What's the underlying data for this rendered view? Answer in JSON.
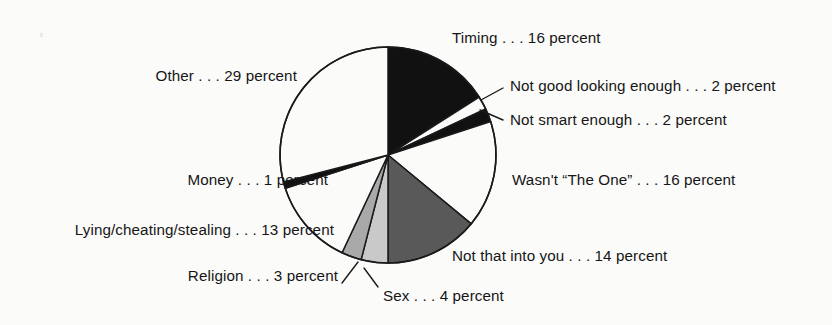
{
  "figure": {
    "background_color": "#fbfbfa",
    "text_color": "#161616",
    "outline_color": "#1a1a1a"
  },
  "chart_data": {
    "type": "pie",
    "title": "",
    "xlabel": "",
    "ylabel": "",
    "units": "percent",
    "start_angle_deg": 0,
    "direction": "clockwise",
    "center": {
      "x": 388,
      "y": 155
    },
    "radius": 108,
    "legend": "none",
    "grid": false,
    "categories": [
      "Timing",
      "Not good looking enough",
      "Not smart enough",
      "Wasn't “The One”",
      "Not that into you",
      "Sex",
      "Religion",
      "Lying/cheating/stealing",
      "Money",
      "Other"
    ],
    "values": [
      16,
      2,
      2,
      16,
      14,
      4,
      3,
      13,
      1,
      29
    ],
    "colors": [
      "#111111",
      "#fbfbfa",
      "#111111",
      "#fbfbfa",
      "#595959",
      "#c9c9c9",
      "#a9a9a9",
      "#fbfbfa",
      "#111111",
      "#fbfbfa"
    ],
    "slices": [
      {
        "label": "Timing",
        "value": 16,
        "color": "#111111"
      },
      {
        "label": "Not good looking enough",
        "value": 2,
        "color": "#fbfbfa"
      },
      {
        "label": "Not smart enough",
        "value": 2,
        "color": "#111111"
      },
      {
        "label": "Wasn't “The One”",
        "value": 16,
        "color": "#fbfbfa"
      },
      {
        "label": "Not that into you",
        "value": 14,
        "color": "#595959"
      },
      {
        "label": "Sex",
        "value": 4,
        "color": "#c9c9c9"
      },
      {
        "label": "Religion",
        "value": 3,
        "color": "#a9a9a9"
      },
      {
        "label": "Lying/cheating/stealing",
        "value": 13,
        "color": "#fbfbfa"
      },
      {
        "label": "Money",
        "value": 1,
        "color": "#111111"
      },
      {
        "label": "Other",
        "value": 29,
        "color": "#fbfbfa"
      }
    ]
  },
  "labels": {
    "timing": "Timing . . . 16 percent",
    "not_good_looking": "Not good looking enough . . . 2 percent",
    "not_smart": "Not smart enough . . . 2 percent",
    "wasnt_the_one": "Wasn't “The One” . . . 16 percent",
    "not_that_into_you": "Not that into you . . . 14 percent",
    "sex": "Sex . . . 4 percent",
    "religion": "Religion . . . 3 percent",
    "lying_cheating_stealing": "Lying/cheating/stealing . . . 13 percent",
    "money": "Money . . . 1 percent",
    "other": "Other . . . 29 percent"
  }
}
